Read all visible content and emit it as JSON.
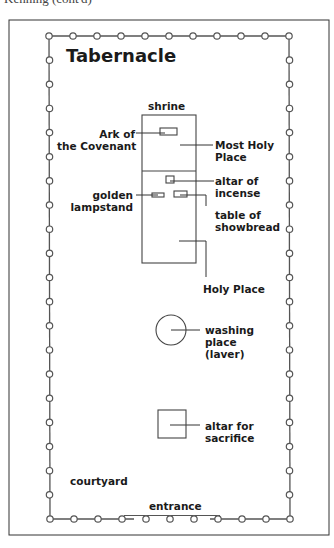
{
  "caption_partial": "Kenning (cont'd)",
  "diagram": {
    "title": "Tabernacle",
    "labels": {
      "shrine": "shrine",
      "ark": [
        "Ark of",
        "the Covenant"
      ],
      "most_holy": [
        "Most Holy",
        "Place"
      ],
      "altar_incense": [
        "altar of",
        "incense"
      ],
      "lampstand": [
        "golden",
        "lampstand"
      ],
      "showbread": [
        "table of",
        "showbread"
      ],
      "holy_place": "Holy Place",
      "laver": [
        "washing",
        "place",
        "(laver)"
      ],
      "altar_sacrifice": [
        "altar for",
        "sacrifice"
      ],
      "courtyard": "courtyard",
      "entrance": "entrance"
    },
    "fence": {
      "posts_top": 11,
      "posts_bottom": 11,
      "posts_side": 21,
      "entrance_open_posts": 3
    }
  }
}
